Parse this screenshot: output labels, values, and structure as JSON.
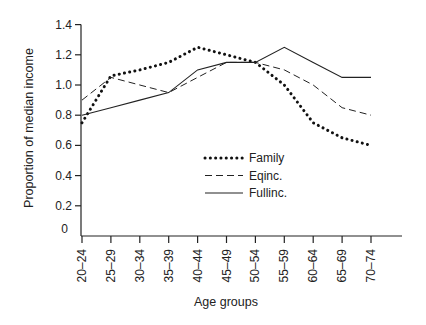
{
  "chart_data": {
    "type": "line",
    "title": "",
    "xlabel": "Age groups",
    "ylabel": "Proportion of median income",
    "ylim": [
      0,
      1.4
    ],
    "yticks": [
      "0",
      "0.2",
      "0.4",
      "0.6",
      "0.8",
      "1.0",
      "1.2",
      "1.4"
    ],
    "grid": false,
    "legend_position": "inside-center-right",
    "categories": [
      "20–24",
      "25–29",
      "30–34",
      "35–39",
      "40–44",
      "45–49",
      "50–54",
      "55–59",
      "60–64",
      "65–69",
      "70–74"
    ],
    "series": [
      {
        "name": "Family",
        "style": "dotted",
        "values": [
          0.75,
          1.06,
          1.1,
          1.15,
          1.25,
          1.2,
          1.15,
          1.0,
          0.75,
          0.65,
          0.6
        ]
      },
      {
        "name": "Eqinc.",
        "style": "dashed",
        "values": [
          0.9,
          1.05,
          1.0,
          0.95,
          1.05,
          1.15,
          1.15,
          1.1,
          1.0,
          0.85,
          0.8
        ]
      },
      {
        "name": "Fullinc.",
        "style": "solid",
        "values": [
          0.8,
          0.85,
          0.9,
          0.95,
          1.1,
          1.15,
          1.15,
          1.25,
          1.15,
          1.05,
          1.05
        ]
      }
    ]
  }
}
